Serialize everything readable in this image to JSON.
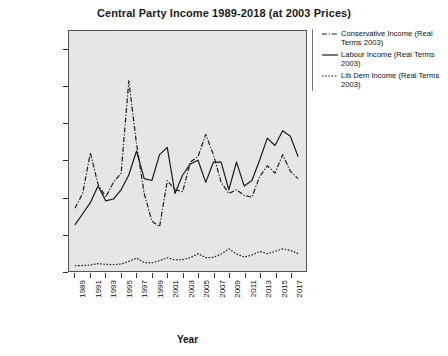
{
  "chart_data": {
    "type": "line",
    "title": "Central Party Income 1989-2018 (at 2003 Prices)",
    "xlabel": "Year",
    "ylabel": "£000s",
    "ylim": [
      0,
      65000
    ],
    "xlim": [
      1989,
      2018
    ],
    "grid": false,
    "legend_position": "right",
    "ytick_labels": [
      "60,000",
      "50,000",
      "40,000",
      "30,000",
      "20,000",
      "10,000",
      "0"
    ],
    "ytick_values": [
      60000,
      50000,
      40000,
      30000,
      20000,
      10000,
      0
    ],
    "xtick_labels": [
      "1989",
      "1991",
      "1993",
      "1995",
      "1997",
      "1999",
      "2001",
      "2003",
      "2005",
      "2007",
      "2009",
      "2011",
      "2013",
      "2015",
      "2017"
    ],
    "xtick_values": [
      1989,
      1991,
      1993,
      1995,
      1997,
      1999,
      2001,
      2003,
      2005,
      2007,
      2009,
      2011,
      2013,
      2015,
      2017
    ],
    "x": [
      1989,
      1990,
      1991,
      1992,
      1993,
      1994,
      1995,
      1996,
      1997,
      1998,
      1999,
      2000,
      2001,
      2002,
      2003,
      2004,
      2005,
      2006,
      2007,
      2008,
      2009,
      2010,
      2011,
      2012,
      2013,
      2014,
      2015,
      2016,
      2017,
      2018
    ],
    "series": [
      {
        "name": "Conservative Income (Real Terms 2003)",
        "style": "dash-dot",
        "color": "#1a1a1a",
        "values": [
          17000,
          21000,
          32000,
          23500,
          20000,
          24000,
          26500,
          51500,
          34500,
          21000,
          13500,
          12000,
          24500,
          22000,
          21500,
          29500,
          31000,
          37000,
          31500,
          24000,
          21000,
          22000,
          20500,
          20000,
          25500,
          28500,
          26500,
          31500,
          27000,
          25000
        ]
      },
      {
        "name": "Labour Income (Real Terms 2003)",
        "style": "solid",
        "color": "#1a1a1a",
        "values": [
          12500,
          15500,
          18500,
          23000,
          19000,
          19500,
          22000,
          26000,
          32500,
          25000,
          24500,
          31500,
          33500,
          21000,
          26000,
          29000,
          30000,
          24000,
          29500,
          29500,
          22000,
          29500,
          23000,
          24500,
          30000,
          36000,
          34000,
          38000,
          36500,
          31000
        ]
      },
      {
        "name": "Lib Dem Income (Real Terms 2003)",
        "style": "dotted",
        "color": "#1a1a1a",
        "values": [
          1400,
          1500,
          1600,
          2000,
          1800,
          1700,
          1900,
          2600,
          3500,
          2300,
          2200,
          2800,
          3600,
          3000,
          3100,
          3600,
          4700,
          3600,
          3700,
          4600,
          6000,
          4600,
          3800,
          4300,
          5300,
          4700,
          5300,
          6000,
          5600,
          4700
        ]
      }
    ]
  },
  "legend": {
    "items": [
      {
        "label": "Conservative Income (Real Terms 2003)",
        "style": "dash-dot"
      },
      {
        "label": "Labour Income (Real Terms 2003)",
        "style": "solid"
      },
      {
        "label": "Lib Dem Income (Real Terms 2003)",
        "style": "dotted"
      }
    ]
  }
}
